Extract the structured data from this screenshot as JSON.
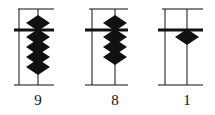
{
  "diagram": {
    "type": "abacus",
    "colors": {
      "ink": "#111111",
      "background": "#ffffff"
    },
    "rods": [
      {
        "label": "9",
        "upper_beads": 1,
        "lower_beads": 4,
        "frame_x": [
          14,
          54
        ],
        "post_x": 19,
        "rod_x": 38,
        "label_x": 23
      },
      {
        "label": "8",
        "upper_beads": 1,
        "lower_beads": 3,
        "frame_x": [
          85,
          128
        ],
        "post_x": 92,
        "rod_x": 115,
        "label_x": 100
      },
      {
        "label": "1",
        "upper_beads": 0,
        "lower_beads": 1,
        "frame_x": [
          158,
          203
        ],
        "post_x": 165,
        "rod_x": 187,
        "label_x": 172
      }
    ]
  }
}
